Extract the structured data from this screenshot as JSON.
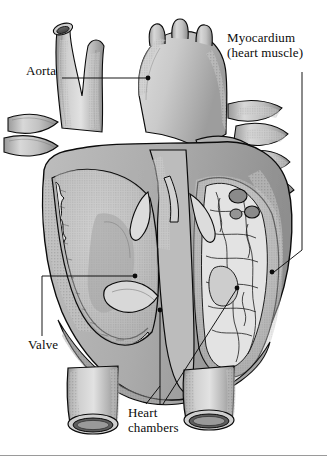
{
  "figure": {
    "kind": "anatomical-illustration",
    "style": "grayscale-stippled-engraving",
    "background_color": "#ffffff",
    "ink_color": "#0b0b0b",
    "base_fill": "#b9b9b9",
    "mid_fill": "#a6a6a6",
    "light_fill": "#d6d6d6",
    "highlight_fill": "#e8e8e8",
    "shadow_fill": "#8a8a8a"
  },
  "labels": {
    "aorta": {
      "text": "Aorta",
      "leader": "horizontal-right-to-aortic-arch"
    },
    "myocardium": {
      "line1": "Myocardium",
      "line2": "(heart muscle)",
      "leader": "down-right-side-then-left-to-wall"
    },
    "valve": {
      "text": "Valve",
      "leader": "up-then-right-to-valve-leaflet"
    },
    "heart_chambers": {
      "line1": "Heart",
      "line2": "chambers",
      "leader": "two-branches-to-left-and-right-chamber"
    }
  },
  "rule": {
    "name": "bottom-divider",
    "color": "#9a9a9a"
  }
}
